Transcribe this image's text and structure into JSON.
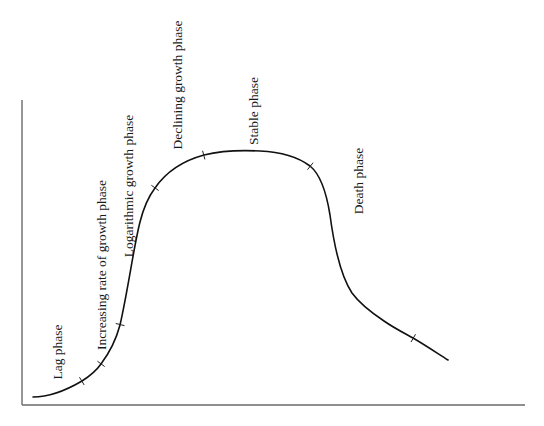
{
  "diagram": {
    "type": "bacterial-growth-curve",
    "axes": {
      "x_label": "",
      "y_label": "",
      "y_axis": {
        "x": 22,
        "y_top": 100,
        "y_bottom": 405
      },
      "x_axis": {
        "y": 405,
        "x_left": 22,
        "x_right": 525
      },
      "color": "#6a6a6a"
    },
    "curve": {
      "color": "#111111",
      "path": "M33,397 C50,397 65,391 82,381 C90,376 96,371 101,364 C110,352 116,340 120,325 C128,290 134,245 140,222 C144,206 149,196 155,188 C166,172 182,161 204,155 C220,151 240,150 260,151 C283,152 298,157 310,166 C320,174 326,190 330,215 C334,245 340,275 352,293 C360,304 372,313 384,321 C394,328 404,333 413,338 C425,345 437,353 448,360",
      "phase_boundary_ticks": [
        {
          "x": 82,
          "y": 381
        },
        {
          "x": 101,
          "y": 364
        },
        {
          "x": 120,
          "y": 325
        },
        {
          "x": 155,
          "y": 188
        },
        {
          "x": 204,
          "y": 155
        },
        {
          "x": 310,
          "y": 166
        },
        {
          "x": 413,
          "y": 338
        }
      ]
    },
    "phases": [
      {
        "label": "Lag phase",
        "x": 57,
        "y": 352
      },
      {
        "label": "Increasing rate of growth phase",
        "x": 101,
        "y": 265
      },
      {
        "label": "Logarithmic growth phase",
        "x": 128,
        "y": 186
      },
      {
        "label": "Declining growth phase",
        "x": 177,
        "y": 85
      },
      {
        "label": "Stable phase",
        "x": 253,
        "y": 111
      },
      {
        "label": "Death phase",
        "x": 358,
        "y": 181
      }
    ]
  }
}
